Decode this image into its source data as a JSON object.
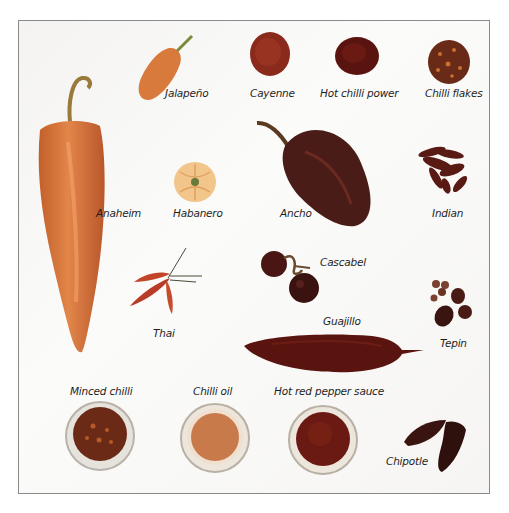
{
  "figure": {
    "labels": {
      "jalapeno": "Jalapeño",
      "cayenne": "Cayenne",
      "hot_chilli_power": "Hot chilli power",
      "chilli_flakes": "Chilli flakes",
      "anaheim": "Anaheim",
      "habanero": "Habanero",
      "ancho": "Ancho",
      "indian": "Indian",
      "cascabel": "Cascabel",
      "thai": "Thai",
      "guajillo": "Guajillo",
      "tepin": "Tepin",
      "minced_chilli": "Minced chilli",
      "chilli_oil": "Chilli oil",
      "hot_red_pepper_sauce": "Hot red pepper sauce",
      "chipotle": "Chipotle"
    },
    "colors": {
      "anaheim": "#d9742e",
      "jalapeno": "#d77a3a",
      "habanero": "#f0b870",
      "ancho": "#4a1c17",
      "cayenne": "#8a2a1c",
      "hot_chilli_power": "#5a1410",
      "guajillo": "#5a1410",
      "border": "#8a8a8a"
    }
  }
}
